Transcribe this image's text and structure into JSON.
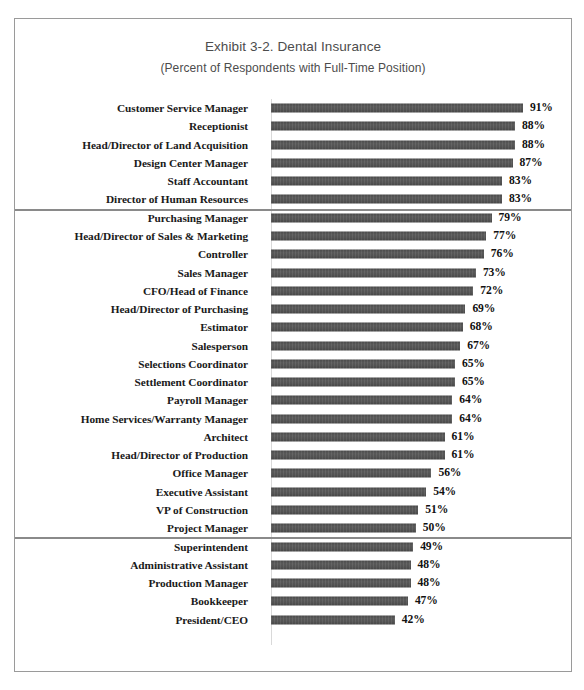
{
  "chart_data": {
    "type": "bar",
    "orientation": "horizontal",
    "title": "Exhibit 3-2. Dental Insurance",
    "subtitle": "(Percent of Respondents with Full-Time Position)",
    "xlabel": "",
    "ylabel": "",
    "xlim": [
      0,
      100
    ],
    "grid": false,
    "legend": null,
    "value_suffix": "%",
    "value_labels_shown": true,
    "groups": [
      {
        "index": 0,
        "categories": [
          "Customer Service Manager",
          "Receptionist",
          "Head/Director of Land Acquisition",
          "Design Center Manager",
          "Staff Accountant",
          "Director of Human Resources"
        ],
        "values": [
          91,
          88,
          88,
          87,
          83,
          83
        ],
        "value_labels": [
          "91%",
          "88%",
          "88%",
          "87%",
          "83%",
          "83%"
        ]
      },
      {
        "index": 1,
        "categories": [
          "Purchasing Manager",
          "Head/Director of Sales & Marketing",
          "Controller",
          "Sales Manager",
          "CFO/Head of Finance",
          "Head/Director of Purchasing",
          "Estimator",
          "Salesperson",
          "Selections Coordinator",
          "Settlement Coordinator",
          "Payroll Manager",
          "Home Services/Warranty Manager",
          "Architect",
          "Head/Director of Production",
          "Office Manager",
          "Executive Assistant",
          "VP of Construction",
          "Project Manager"
        ],
        "values": [
          79,
          77,
          76,
          73,
          72,
          69,
          68,
          67,
          65,
          65,
          64,
          64,
          61,
          61,
          56,
          54,
          51,
          50
        ],
        "value_labels": [
          "79%",
          "77%",
          "76%",
          "73%",
          "72%",
          "69%",
          "68%",
          "67%",
          "65%",
          "65%",
          "64%",
          "64%",
          "61%",
          "61%",
          "56%",
          "54%",
          "51%",
          "50%"
        ]
      },
      {
        "index": 2,
        "categories": [
          "Superintendent",
          "Administrative Assistant",
          "Production Manager",
          "Bookkeeper",
          "President/CEO"
        ],
        "values": [
          49,
          48,
          48,
          47,
          42
        ],
        "value_labels": [
          "49%",
          "48%",
          "48%",
          "47%",
          "42%"
        ]
      }
    ],
    "categories": [
      "Customer Service Manager",
      "Receptionist",
      "Head/Director of Land Acquisition",
      "Design Center Manager",
      "Staff Accountant",
      "Director of Human Resources",
      "Purchasing Manager",
      "Head/Director of Sales & Marketing",
      "Controller",
      "Sales Manager",
      "CFO/Head of Finance",
      "Head/Director of Purchasing",
      "Estimator",
      "Salesperson",
      "Selections Coordinator",
      "Settlement Coordinator",
      "Payroll Manager",
      "Home Services/Warranty Manager",
      "Architect",
      "Head/Director of Production",
      "Office Manager",
      "Executive Assistant",
      "VP of Construction",
      "Project Manager",
      "Superintendent",
      "Administrative Assistant",
      "Production Manager",
      "Bookkeeper",
      "President/CEO"
    ],
    "values": [
      91,
      88,
      88,
      87,
      83,
      83,
      79,
      77,
      76,
      73,
      72,
      69,
      68,
      67,
      65,
      65,
      64,
      64,
      61,
      61,
      56,
      54,
      51,
      50,
      49,
      48,
      48,
      47,
      42
    ],
    "colors": {
      "bar": "#565656",
      "title_text": "#4c4c4c",
      "label_text": "#1a1a1a",
      "separator": "#8a8a8a",
      "frame_border": "#9a9a9a",
      "axis_line": "#d9d9d9",
      "background": "#ffffff"
    }
  }
}
